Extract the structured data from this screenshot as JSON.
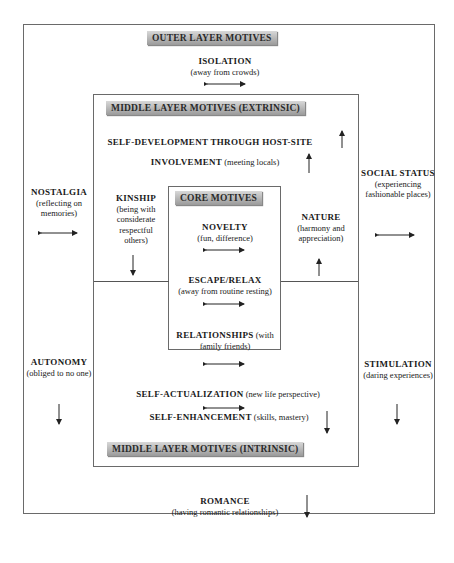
{
  "headers": {
    "outer": "OUTER LAYER MOTIVES",
    "middle_extrinsic": "MIDDLE LAYER MOTIVES (EXTRINSIC)",
    "core": "CORE MOTIVES",
    "middle_intrinsic": "MIDDLE LAYER MOTIVES (INTRINSIC)"
  },
  "outer": {
    "isolation": {
      "title": "ISOLATION",
      "desc": "(away from crowds)",
      "arrow": "double-arrow"
    },
    "nostalgia": {
      "title": "NOSTALGIA",
      "desc": "(reflecting on memories)",
      "arrow": "double-arrow"
    },
    "autonomy": {
      "title": "AUTONOMY",
      "desc": "(obliged to no one)",
      "arrow": "down-arrow"
    },
    "social_status": {
      "title": "SOCIAL STATUS",
      "desc": "(experiencing fashionable places)",
      "arrow": "double-arrow"
    },
    "stimulation": {
      "title": "STIMULATION",
      "desc": "(daring experiences)",
      "arrow": "down-arrow"
    },
    "romance": {
      "title": "ROMANCE",
      "desc": "(having romantic relationships)",
      "arrow": "down-arrow"
    }
  },
  "middle": {
    "self_development": {
      "title": "SELF-DEVELOPMENT THROUGH HOST-SITE",
      "arrow": "up-arrow"
    },
    "involvement": {
      "title": "INVOLVEMENT",
      "desc": "(meeting locals)",
      "arrow": "up-arrow"
    },
    "kinship": {
      "title": "KINSHIP",
      "desc": "(being with considerate respectful others)",
      "arrow": "down-arrow"
    },
    "nature": {
      "title": "NATURE",
      "desc": "(harmony and appreciation)",
      "arrow": "up-arrow"
    },
    "self_actualization": {
      "title": "SELF-ACTUALIZATION",
      "desc": "(new life perspective)",
      "arrow": "double-arrow"
    },
    "self_enhancement": {
      "title": "SELF-ENHANCEMENT",
      "desc": "(skills, mastery)",
      "arrow": "down-arrow"
    }
  },
  "core": {
    "novelty": {
      "title": "NOVELTY",
      "desc": "(fun, difference)",
      "arrow": "double-arrow"
    },
    "escape_relax": {
      "title": "ESCAPE/RELAX",
      "desc": "(away from routine resting)",
      "arrow": "double-arrow"
    },
    "relationships": {
      "title": "RELATIONSHIPS",
      "desc": "(with family friends)",
      "arrow": "double-arrow"
    }
  }
}
